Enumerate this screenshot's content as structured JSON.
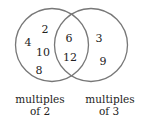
{
  "diagram": {
    "type": "venn",
    "sets": [
      {
        "label_line1": "multiples",
        "label_line2": "of 2",
        "only": [
          "2",
          "4",
          "10",
          "8"
        ]
      },
      {
        "label_line1": "multiples",
        "label_line2": "of 3",
        "only": [
          "3",
          "9"
        ]
      }
    ],
    "intersection": [
      "6",
      "12"
    ],
    "colors": {
      "circle_stroke": "#777777",
      "text": "#222222"
    }
  }
}
